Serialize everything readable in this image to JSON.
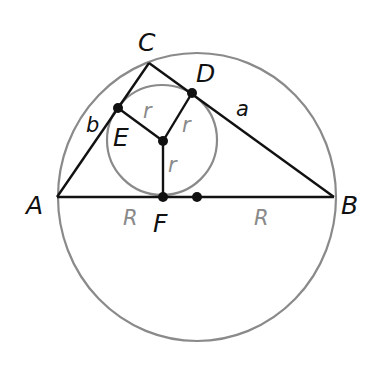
{
  "diagram": {
    "colors": {
      "line": "#111111",
      "circle": "#8a8a8a",
      "gray_label": "#8a8a8a",
      "background": "#ffffff"
    },
    "points": {
      "A": {
        "label": "A",
        "x": 57,
        "y": 197
      },
      "B": {
        "label": "B",
        "x": 334,
        "y": 197
      },
      "C": {
        "label": "C",
        "x": 149,
        "y": 63
      },
      "D": {
        "label": "D",
        "x": 192,
        "y": 93
      },
      "E": {
        "label": "E",
        "x": 118,
        "y": 108
      },
      "F": {
        "label": "F",
        "x": 163,
        "y": 197
      },
      "I": {
        "label": "",
        "x": 163,
        "y": 141
      },
      "O": {
        "label": "",
        "x": 197,
        "y": 197
      }
    },
    "side_labels": {
      "a": "a",
      "b": "b"
    },
    "radius_labels": {
      "inradius": [
        "r",
        "r",
        "r"
      ],
      "circumradius": [
        "R",
        "R"
      ]
    },
    "circumcircle": {
      "cx": 197,
      "cy": 197,
      "rx": 139,
      "ry": 144
    },
    "incircle": {
      "cx": 162,
      "cy": 140,
      "r": 55
    }
  }
}
